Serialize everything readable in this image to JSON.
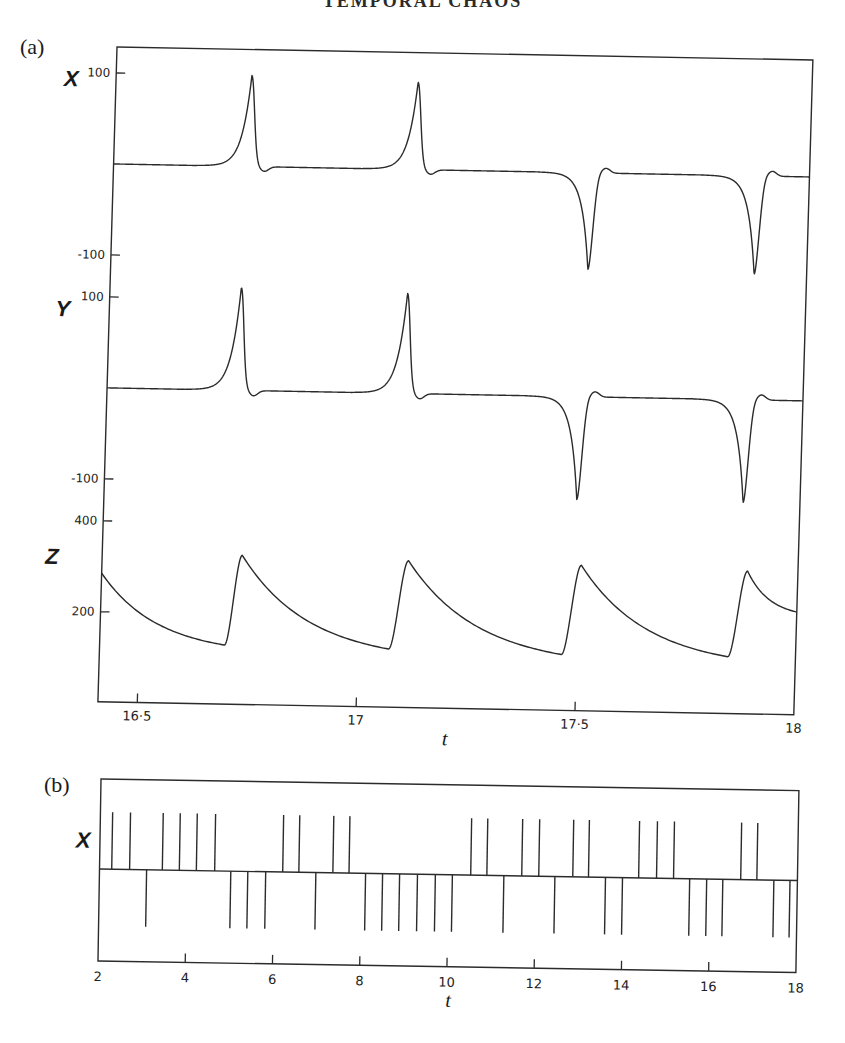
{
  "page": {
    "running_head": "TEMPORAL CHAOS"
  },
  "panels": [
    {
      "id": "a",
      "label": "(a)"
    },
    {
      "id": "b",
      "label": "(b)"
    }
  ],
  "chart_data": [
    {
      "type": "line",
      "panel": "(a)",
      "title": "",
      "xlabel": "t",
      "x_range": [
        16.41,
        18.0
      ],
      "x_ticks": [
        16.5,
        17,
        17.5,
        18
      ],
      "x_tick_labels": [
        "16·5",
        "17",
        "17·5",
        "18"
      ],
      "grid": false,
      "legend": "none",
      "subplots": [
        {
          "variable": "X",
          "ylabel": "X",
          "y_ticks": [
            100,
            -100
          ],
          "y_tick_labels": [
            "100",
            "-100"
          ],
          "baseline": 0,
          "pulses": [
            {
              "t": 16.72,
              "peak": 100,
              "sign": 1
            },
            {
              "t": 17.1,
              "peak": 96,
              "sign": 1
            },
            {
              "t": 17.5,
              "peak": -106,
              "sign": -1
            },
            {
              "t": 17.88,
              "peak": -108,
              "sign": -1
            }
          ]
        },
        {
          "variable": "Y",
          "ylabel": "Y",
          "y_ticks": [
            100,
            -100
          ],
          "y_tick_labels": [
            "100",
            "-100"
          ],
          "baseline": 0,
          "pulses": [
            {
              "t": 16.71,
              "peak": 113,
              "sign": 1
            },
            {
              "t": 17.09,
              "peak": 110,
              "sign": 1
            },
            {
              "t": 17.49,
              "peak": -113,
              "sign": -1
            },
            {
              "t": 17.87,
              "peak": -113,
              "sign": -1
            }
          ]
        },
        {
          "variable": "Z",
          "ylabel": "Z",
          "y_ticks": [
            400,
            200
          ],
          "y_tick_labels": [
            "400",
            "200"
          ],
          "start_value": 285,
          "cycles": [
            {
              "t_min": 16.695,
              "z_min": 132,
              "t_peak": 16.73,
              "z_peak": 330
            },
            {
              "t_min": 17.07,
              "z_min": 130,
              "t_peak": 17.11,
              "z_peak": 325
            },
            {
              "t_min": 17.465,
              "z_min": 125,
              "t_peak": 17.505,
              "z_peak": 322
            },
            {
              "t_min": 17.845,
              "z_min": 127,
              "t_peak": 17.885,
              "z_peak": 316
            }
          ],
          "end_value": 228
        }
      ]
    },
    {
      "type": "bar",
      "panel": "(b)",
      "title": "",
      "xlabel": "t",
      "ylabel": "X",
      "x_range": [
        2,
        18
      ],
      "x_ticks": [
        2,
        4,
        6,
        8,
        10,
        12,
        14,
        16,
        18
      ],
      "x_tick_labels": [
        "2",
        "4",
        "6",
        "8",
        "10",
        "12",
        "14",
        "16",
        "18"
      ],
      "grid": false,
      "legend": "none",
      "description": "Sign of successive X pulses (up = positive peak, down = negative peak)",
      "spikes": [
        {
          "t": 2.28,
          "sign": 1
        },
        {
          "t": 2.69,
          "sign": 1
        },
        {
          "t": 3.08,
          "sign": -1
        },
        {
          "t": 3.44,
          "sign": 1
        },
        {
          "t": 3.83,
          "sign": 1
        },
        {
          "t": 4.22,
          "sign": 1
        },
        {
          "t": 4.64,
          "sign": 1
        },
        {
          "t": 5.01,
          "sign": -1
        },
        {
          "t": 5.4,
          "sign": -1
        },
        {
          "t": 5.81,
          "sign": -1
        },
        {
          "t": 6.2,
          "sign": 1
        },
        {
          "t": 6.57,
          "sign": 1
        },
        {
          "t": 6.96,
          "sign": -1
        },
        {
          "t": 7.35,
          "sign": 1
        },
        {
          "t": 7.72,
          "sign": 1
        },
        {
          "t": 8.1,
          "sign": -1
        },
        {
          "t": 8.49,
          "sign": -1
        },
        {
          "t": 8.88,
          "sign": -1
        },
        {
          "t": 9.29,
          "sign": -1
        },
        {
          "t": 9.7,
          "sign": -1
        },
        {
          "t": 10.09,
          "sign": -1
        },
        {
          "t": 10.51,
          "sign": 1
        },
        {
          "t": 10.88,
          "sign": 1
        },
        {
          "t": 11.27,
          "sign": -1
        },
        {
          "t": 11.68,
          "sign": 1
        },
        {
          "t": 12.07,
          "sign": 1
        },
        {
          "t": 12.44,
          "sign": -1
        },
        {
          "t": 12.85,
          "sign": 1
        },
        {
          "t": 13.21,
          "sign": 1
        },
        {
          "t": 13.6,
          "sign": -1
        },
        {
          "t": 13.99,
          "sign": -1
        },
        {
          "t": 14.36,
          "sign": 1
        },
        {
          "t": 14.77,
          "sign": 1
        },
        {
          "t": 15.16,
          "sign": 1
        },
        {
          "t": 15.53,
          "sign": -1
        },
        {
          "t": 15.92,
          "sign": -1
        },
        {
          "t": 16.29,
          "sign": -1
        },
        {
          "t": 16.7,
          "sign": 1
        },
        {
          "t": 17.07,
          "sign": 1
        },
        {
          "t": 17.46,
          "sign": -1
        },
        {
          "t": 17.83,
          "sign": -1
        }
      ]
    }
  ]
}
